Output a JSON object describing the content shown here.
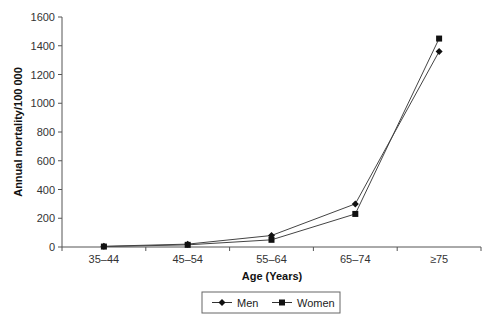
{
  "chart_data": {
    "type": "line",
    "title": "",
    "xlabel": "Age (Years)",
    "ylabel": "Annual mortality/100 000",
    "categories": [
      "35–44",
      "45–54",
      "55–64",
      "65–74",
      "≥75"
    ],
    "series": [
      {
        "name": "Men",
        "marker": "diamond",
        "values": [
          5,
          20,
          80,
          300,
          1360
        ]
      },
      {
        "name": "Women",
        "marker": "square",
        "values": [
          3,
          15,
          50,
          230,
          1450
        ]
      }
    ],
    "ylim": [
      0,
      1600
    ],
    "yticks": [
      0,
      200,
      400,
      600,
      800,
      1000,
      1200,
      1400,
      1600
    ],
    "grid": false,
    "legend_position": "bottom"
  },
  "colors": {
    "line": "#444444",
    "marker": "#111111",
    "axis": "#555555"
  }
}
